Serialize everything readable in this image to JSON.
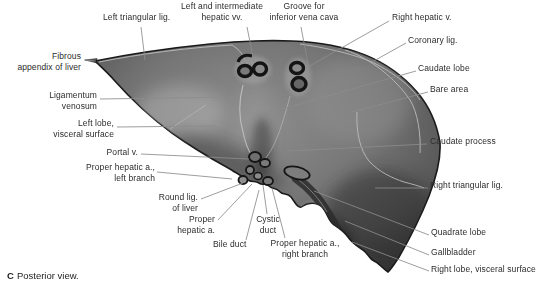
{
  "figure": {
    "caption": {
      "letter": "C",
      "text": "Posterior view."
    },
    "labels": {
      "left_triangular_lig": "Left triangular lig.",
      "left_intermediate_hepatic_vv": "Left and intermediate\nhepatic vv.",
      "groove_inferior_vena_cava": "Groove for\ninferior vena cava",
      "right_hepatic_v": "Right hepatic v.",
      "coronary_lig": "Coronary lig.",
      "caudate_lobe": "Caudate lobe",
      "bare_area": "Bare area",
      "caudate_process": "Caudate process",
      "right_triangular_lig": "Right triangular lig.",
      "quadrate_lobe": "Quadrate lobe",
      "gallbladder": "Gallbladder",
      "right_lobe_visceral_surface": "Right lobe, visceral surface",
      "fibrous_appendix_of_liver": "Fibrous\nappendix of liver",
      "ligamentum_venosum": "Ligamentum\nvenosum",
      "left_lobe_visceral_surface": "Left lobe,\nvisceral surface",
      "portal_v": "Portal v.",
      "proper_hepatic_a_left_branch": "Proper hepatic a.,\nleft branch",
      "round_lig_of_liver": "Round lig.\nof liver",
      "proper_hepatic_a": "Proper\nhepatic a.",
      "bile_duct": "Bile duct",
      "cystic_duct": "Cystic\nduct",
      "proper_hepatic_a_right_branch": "Proper hepatic a.,\nright branch"
    },
    "colors": {
      "background": "#ffffff",
      "label_text": "#2b2b2b",
      "leader_line": "#8c8c8c",
      "liver_base": "#757575",
      "liver_edge": "#1a1a1a",
      "liver_highlight": "#b0b0b0"
    }
  }
}
